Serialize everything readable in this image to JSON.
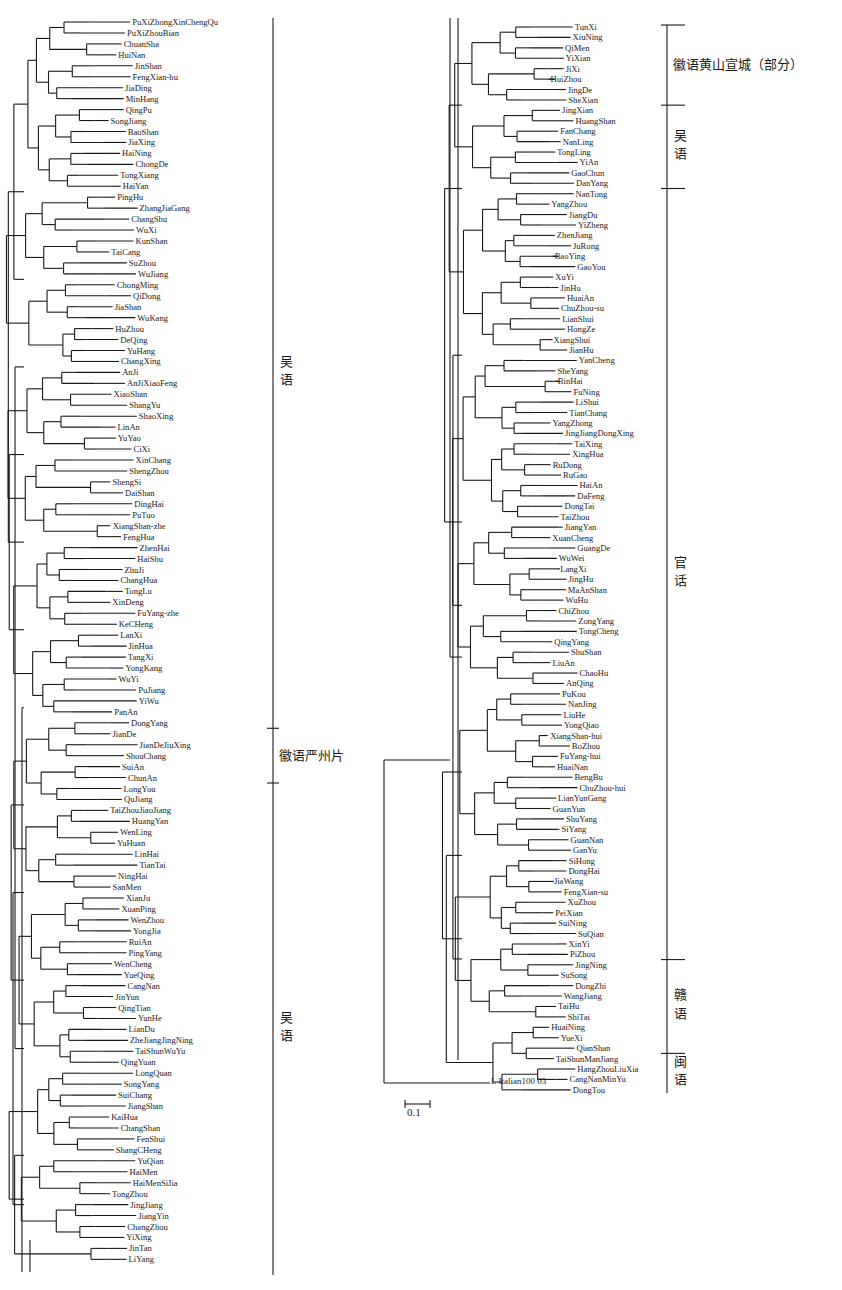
{
  "figure": {
    "type": "phylogenetic-tree",
    "scale_bar_label": "0.1",
    "outgroup_label": "L Italian100 03"
  },
  "left_tree": {
    "leaves": [
      "PuXiZhongXinChengQu",
      "PuXiZhouBian",
      "ChuanSha",
      "HuiNan",
      "JinShan",
      "FengXian-hu",
      "JiaDing",
      "MinHang",
      "QingPu",
      "SongJiang",
      "BaoShan",
      "JiaXing",
      "HaiNing",
      "ChongDe",
      "TongXiang",
      "HaiYan",
      "PingHu",
      "ZhangJiaGang",
      "ChangShu",
      "WuXi",
      "KunShan",
      "TaiCang",
      "SuZhou",
      "WuJiang",
      "ChongMing",
      "QiDong",
      "JiaShan",
      "WuKang",
      "HuZhou",
      "DeQing",
      "YuHang",
      "ChangXing",
      "AnJi",
      "AnJiXiaoFeng",
      "XiaoShan",
      "ShangYu",
      "ShaoXing",
      "LinAn",
      "YuYao",
      "CiXi",
      "XinChang",
      "ShengZhou",
      "ShengSi",
      "DaiShan",
      "DingHai",
      "PuTuo",
      "XiangShan-zhe",
      "FengHua",
      "ZhenHai",
      "HaiShu",
      "ZhuJi",
      "ChangHua",
      "TongLu",
      "XinDeng",
      "FuYang-zhe",
      "KeCHeng",
      "LanXi",
      "JinHua",
      "TangXi",
      "YongKang",
      "WuYi",
      "PuJiang",
      "YiWu",
      "PanAn",
      "DongYang",
      "JianDe",
      "JianDeJiuXing",
      "ShouChang",
      "SuiAn",
      "ChunAn",
      "LongYou",
      "QuJiang",
      "TaiZhouJiaoJiang",
      "HuangYan",
      "WenLing",
      "YuHuan",
      "LinHai",
      "TianTai",
      "NingHai",
      "SanMen",
      "XianJu",
      "XuanPing",
      "WenZhou",
      "YongJia",
      "RuiAn",
      "PingYang",
      "WenCheng",
      "YueQing",
      "CangNan",
      "JinYun",
      "QingTian",
      "YunHe",
      "LianDu",
      "ZheJiangJingNing",
      "TaiShunWuYu",
      "QingYuan",
      "LongQuan",
      "SongYang",
      "SuiChang",
      "JiangShan",
      "KaiHua",
      "ChangShan",
      "FenShui",
      "ShangCHeng",
      "YuQian",
      "HaiMen",
      "HaiMenSiJia",
      "TongZhou",
      "JingJiang",
      "JiangYin",
      "ChangZhou",
      "YiXing",
      "JinTan",
      "LiYang"
    ],
    "groups": [
      {
        "label": "吴语",
        "from_leaf": "PuXiZhongXinChengQu",
        "to_leaf": "DongYang"
      },
      {
        "label": "徽语严州片",
        "from_leaf": "JianDe",
        "to_leaf": "ChunAn"
      },
      {
        "label": "吴语",
        "from_leaf": "LongYou",
        "to_leaf": "LiYang"
      }
    ]
  },
  "right_tree": {
    "leaves": [
      "TunXi",
      "XiuNing",
      "QiMen",
      "YiXian",
      "JiXi",
      "HuiZhou",
      "JingDe",
      "SheXian",
      "JingXian",
      "HuangShan",
      "FanChang",
      "NanLing",
      "TongLing",
      "YiAn",
      "GaoChun",
      "DanYang",
      "NanTong",
      "YangZhou",
      "JiangDu",
      "YiZheng",
      "ZhenJiang",
      "JuRong",
      "BaoYing",
      "GaoYou",
      "XuYi",
      "JinHu",
      "HuaiAn",
      "ChuZhou-su",
      "LianShui",
      "HongZe",
      "XiangShui",
      "JianHu",
      "YanCheng",
      "SheYang",
      "BinHai",
      "FuNing",
      "LiShui",
      "TianChang",
      "YangZhong",
      "JingJiangDongXing",
      "TaiXing",
      "XingHua",
      "RuDong",
      "RuGao",
      "HaiAn",
      "DaFeng",
      "DongTai",
      "TaiZhou",
      "JiangYan",
      "XuanCheng",
      "GuangDe",
      "WuWei",
      "LangXi",
      "JingHu",
      "MaAnShan",
      "WuHu",
      "ChiZhou",
      "ZongYang",
      "TongCheng",
      "QingYang",
      "ShuShan",
      "LiuAn",
      "ChaoHu",
      "AnQing",
      "PuKou",
      "NanJing",
      "LiuHe",
      "YongQiao",
      "XiangShan-hui",
      "BoZhou",
      "FuYang-hui",
      "HuaiNan",
      "BengBu",
      "ChuZhou-hui",
      "LianYunGang",
      "GuanYun",
      "ShuYang",
      "SiYang",
      "GuanNan",
      "GanYu",
      "SiHong",
      "DongHai",
      "JiaWang",
      "FengXian-su",
      "XuZhou",
      "PeiXian",
      "SuiNing",
      "SuQian",
      "XinYi",
      "PiZhou",
      "JingNing",
      "SuSong",
      "DongZhi",
      "WangJiang",
      "TaiHu",
      "ShiTai",
      "HuaiNing",
      "YueXi",
      "QianShan",
      "TaiShunManJiang",
      "HangZhouLiuXia",
      "CangNanMinYu",
      "DongTou"
    ],
    "groups": [
      {
        "label": "徽语黄山宣城（部分）",
        "from_leaf": "TunXi",
        "to_leaf": "SheXian"
      },
      {
        "label": "吴语",
        "from_leaf": "JingXian",
        "to_leaf": "DanYang"
      },
      {
        "label": "官话",
        "from_leaf": "NanTong",
        "to_leaf": "PiZhou"
      },
      {
        "label": "赣语",
        "from_leaf": "JingNing",
        "to_leaf": "QianShan"
      },
      {
        "label": "闽语",
        "from_leaf": "TaiShunManJiang",
        "to_leaf": "DongTou"
      }
    ]
  },
  "colors": {
    "line": "#1a1a1a",
    "background": "#ffffff"
  }
}
